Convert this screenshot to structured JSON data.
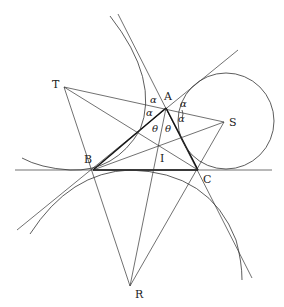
{
  "diagram": {
    "points": {
      "A": {
        "label": "A",
        "x": 166,
        "y": 108,
        "lx": 164,
        "ly": 100
      },
      "B": {
        "label": "B",
        "x": 93,
        "y": 170,
        "lx": 84,
        "ly": 163
      },
      "C": {
        "label": "C",
        "x": 198,
        "y": 170,
        "lx": 203,
        "ly": 183
      },
      "I": {
        "label": "I",
        "x": 159,
        "y": 146,
        "lx": 160,
        "ly": 162
      },
      "R": {
        "label": "R",
        "x": 130,
        "y": 286,
        "lx": 135,
        "ly": 298
      },
      "S": {
        "label": "S",
        "x": 224,
        "y": 122,
        "lx": 229,
        "ly": 126
      },
      "T": {
        "label": "T",
        "x": 64,
        "y": 87,
        "lx": 52,
        "ly": 88
      }
    },
    "angle_labels": [
      {
        "text": "α",
        "x": 150,
        "y": 103
      },
      {
        "text": "α",
        "x": 146,
        "y": 116
      },
      {
        "text": "α",
        "x": 180,
        "y": 107
      },
      {
        "text": "α",
        "x": 178,
        "y": 122
      },
      {
        "text": "θ",
        "x": 152,
        "y": 132
      },
      {
        "text": "θ",
        "x": 165,
        "y": 132
      }
    ],
    "circles": [
      {
        "name": "excircle-S",
        "cx": 226,
        "cy": 121,
        "r": 48
      }
    ]
  }
}
